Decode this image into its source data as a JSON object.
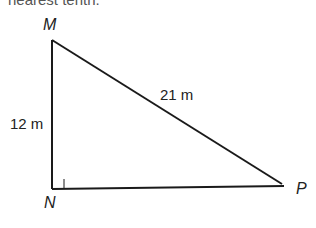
{
  "header_fragment": "nearest tenth.",
  "diagram": {
    "type": "right-triangle",
    "vertices": {
      "M": {
        "label": "M",
        "x": 52,
        "y": 40
      },
      "N": {
        "label": "N",
        "x": 52,
        "y": 189
      },
      "P": {
        "label": "P",
        "x": 288,
        "y": 186
      }
    },
    "right_angle_at": "N",
    "sides": {
      "MN": {
        "label": "12 m"
      },
      "MP": {
        "label": "21 m"
      }
    },
    "stroke_color": "#1a1a1a"
  }
}
